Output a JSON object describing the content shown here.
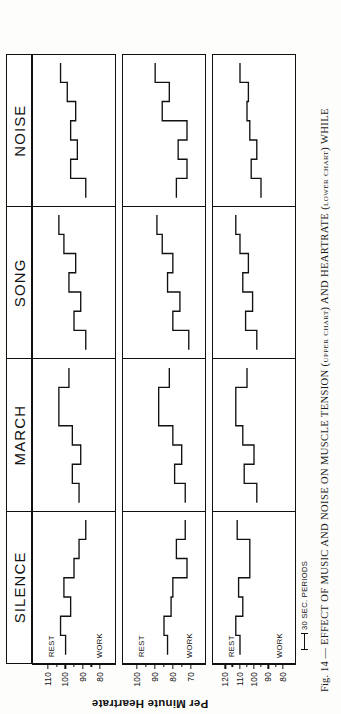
{
  "figure": {
    "number": "Fig. 14",
    "dash": "—",
    "caption": "EFFECT OF MUSIC AND NOISE ON MUSCLE TENSION (upper chart) AND HEARTRATE (lower chart) WHILE",
    "y_axis_title": "Per Minute Heartrate",
    "scale_note": "30 SEC. PERIODS",
    "rest_label": "REST",
    "work_label": "WORK"
  },
  "chart_data": {
    "type": "line",
    "xlabel": "30 SEC. PERIODS",
    "ylabel": "Per Minute Heartrate",
    "grid": false,
    "legend": "none",
    "conditions": [
      "SILENCE",
      "MARCH",
      "SONG",
      "NOISE"
    ],
    "body_types": [
      "MUSCULAR-FAT",
      "MODERATE MIXTURE-MUSCULAR",
      "THIN"
    ],
    "annotations": [
      "REST",
      "WORK"
    ],
    "subplots": [
      {
        "row": "MUSCULAR-FAT",
        "ylim": [
          75,
          115
        ],
        "yticks": [
          110,
          100,
          90,
          80
        ],
        "panels": [
          {
            "condition": "SILENCE",
            "x": [
              0,
              1,
              2,
              3,
              4,
              5,
              6,
              7,
              8,
              9,
              10,
              11,
              12,
              13
            ],
            "values": [
              100,
              100,
              103,
              103,
              97,
              97,
              101,
              101,
              95,
              95,
              92,
              92,
              88,
              88
            ]
          },
          {
            "condition": "MARCH",
            "x": [
              0,
              1,
              2,
              3,
              4,
              5,
              6,
              7,
              8,
              9,
              10,
              11,
              12,
              13
            ],
            "values": [
              92,
              92,
              96,
              96,
              91,
              91,
              96,
              96,
              104,
              104,
              104,
              104,
              98,
              98
            ]
          },
          {
            "condition": "SONG",
            "x": [
              0,
              1,
              2,
              3,
              4,
              5,
              6,
              7,
              8,
              9,
              10,
              11,
              12,
              13
            ],
            "values": [
              88,
              88,
              95,
              95,
              91,
              91,
              98,
              98,
              94,
              94,
              101,
              101,
              104,
              104
            ]
          },
          {
            "condition": "NOISE",
            "x": [
              0,
              1,
              2,
              3,
              4,
              5,
              6,
              7,
              8,
              9,
              10,
              11,
              12,
              13
            ],
            "values": [
              88,
              88,
              97,
              97,
              93,
              93,
              97,
              97,
              94,
              94,
              99,
              99,
              103,
              103
            ]
          }
        ]
      },
      {
        "row": "MODERATE MIXTURE-MUSCULAR",
        "ylim": [
          66,
          104
        ],
        "yticks": [
          100,
          90,
          80,
          70
        ],
        "panels": [
          {
            "condition": "SILENCE",
            "x": [
              0,
              1,
              2,
              3,
              4,
              5,
              6,
              7,
              8,
              9,
              10,
              11,
              12,
              13
            ],
            "values": [
              83,
              83,
              85,
              85,
              81,
              81,
              80,
              80,
              72,
              72,
              78,
              78,
              73,
              73
            ]
          },
          {
            "condition": "MARCH",
            "x": [
              0,
              1,
              2,
              3,
              4,
              5,
              6,
              7,
              8,
              9,
              10,
              11,
              12,
              13
            ],
            "values": [
              73,
              73,
              79,
              79,
              75,
              75,
              80,
              80,
              88,
              88,
              88,
              88,
              82,
              82
            ]
          },
          {
            "condition": "SONG",
            "x": [
              0,
              1,
              2,
              3,
              4,
              5,
              6,
              7,
              8,
              9,
              10,
              11,
              12,
              13
            ],
            "values": [
              71,
              71,
              80,
              80,
              76,
              76,
              83,
              83,
              80,
              80,
              86,
              86,
              89,
              89
            ]
          },
          {
            "condition": "NOISE",
            "x": [
              0,
              1,
              2,
              3,
              4,
              5,
              6,
              7,
              8,
              9,
              10,
              11,
              12,
              13
            ],
            "values": [
              78,
              78,
              72,
              72,
              77,
              77,
              72,
              72,
              86,
              86,
              82,
              82,
              90,
              90
            ]
          }
        ]
      },
      {
        "row": "THIN",
        "ylim": [
          76,
          124
        ],
        "yticks": [
          120,
          110,
          100,
          90,
          80
        ],
        "panels": [
          {
            "condition": "SILENCE",
            "x": [
              0,
              1,
              2,
              3,
              4,
              5,
              6,
              7,
              8,
              9,
              10,
              11,
              12,
              13
            ],
            "values": [
              110,
              110,
              113,
              113,
              108,
              108,
              111,
              111,
              103,
              103,
              103,
              103,
              112,
              112
            ]
          },
          {
            "condition": "MARCH",
            "x": [
              0,
              1,
              2,
              3,
              4,
              5,
              6,
              7,
              8,
              9,
              10,
              11,
              12,
              13
            ],
            "values": [
              98,
              98,
              107,
              107,
              100,
              100,
              108,
              108,
              113,
              113,
              113,
              113,
              105,
              105
            ]
          },
          {
            "condition": "SONG",
            "x": [
              0,
              1,
              2,
              3,
              4,
              5,
              6,
              7,
              8,
              9,
              10,
              11,
              12,
              13
            ],
            "values": [
              98,
              98,
              106,
              106,
              101,
              101,
              108,
              108,
              104,
              104,
              110,
              110,
              113,
              113
            ]
          },
          {
            "condition": "NOISE",
            "x": [
              0,
              1,
              2,
              3,
              4,
              5,
              6,
              7,
              8,
              9,
              10,
              11,
              12,
              13
            ],
            "values": [
              95,
              95,
              102,
              102,
              98,
              98,
              103,
              103,
              105,
              105,
              104,
              104,
              110,
              110
            ]
          }
        ]
      }
    ]
  }
}
